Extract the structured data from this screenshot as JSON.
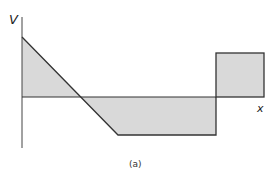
{
  "diagram": {
    "type": "shear-force-diagram",
    "axes": {
      "y_label": "V",
      "x_label": "x"
    },
    "caption": "(a)",
    "colors": {
      "fill": "#d9d9d9",
      "stroke": "#333333",
      "axis": "#444444"
    },
    "regions": [
      {
        "name": "positive-triangle",
        "sign": "positive",
        "shape": "triangle"
      },
      {
        "name": "negative-trapezoid",
        "sign": "negative",
        "shape": "trapezoid"
      },
      {
        "name": "positive-rectangle",
        "sign": "positive",
        "shape": "rectangle"
      }
    ]
  }
}
